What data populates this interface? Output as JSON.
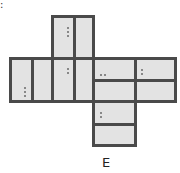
{
  "diagram": {
    "type": "cube-net",
    "label": "E",
    "corner_mark": ":",
    "colors": {
      "border": "#4a4a4a",
      "fill": "#e3e3e3",
      "dot": "#6a6a6a"
    },
    "faces": [
      {
        "id": "top",
        "divider": "vertical",
        "dots": 3,
        "dot_orientation": "vertical",
        "dot_half": "left"
      },
      {
        "id": "left",
        "divider": "vertical",
        "dots": 3,
        "dot_orientation": "vertical",
        "dot_half": "left"
      },
      {
        "id": "center",
        "divider": "vertical",
        "dots": 2,
        "dot_orientation": "vertical",
        "dot_half": "left"
      },
      {
        "id": "right",
        "divider": "horizontal",
        "dots": 2,
        "dot_orientation": "horizontal",
        "dot_half": "top"
      },
      {
        "id": "far-right",
        "divider": "horizontal",
        "dots": 2,
        "dot_orientation": "vertical",
        "dot_half": "top"
      },
      {
        "id": "bottom",
        "divider": "horizontal",
        "dots": 2,
        "dot_orientation": "vertical",
        "dot_half": "top"
      }
    ]
  }
}
